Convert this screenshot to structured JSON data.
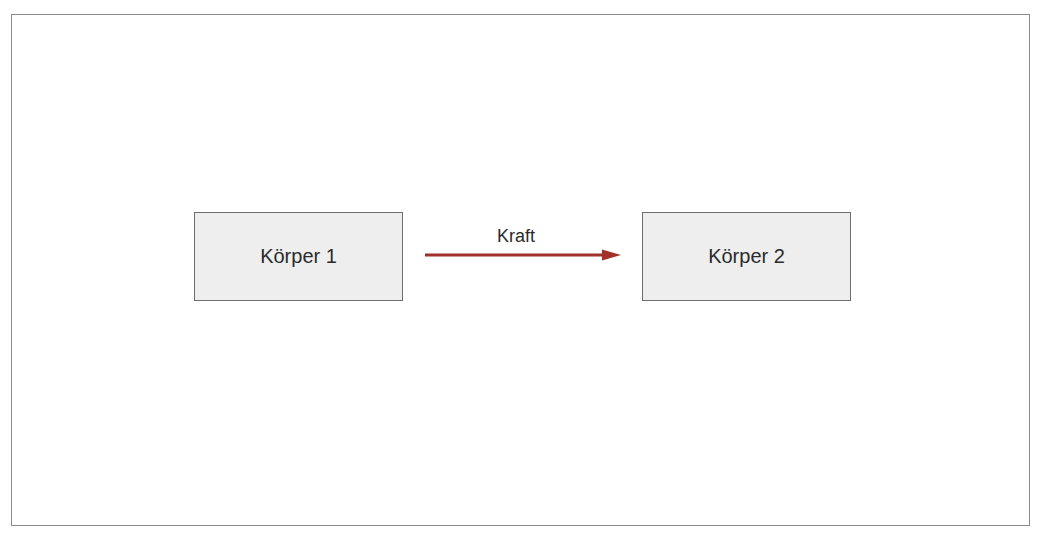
{
  "diagram": {
    "nodes": [
      {
        "id": "body1",
        "label": "Körper 1"
      },
      {
        "id": "body2",
        "label": "Körper 2"
      }
    ],
    "edges": [
      {
        "from": "body1",
        "to": "body2",
        "label": "Kraft",
        "color": "#a0322a"
      }
    ],
    "colors": {
      "box_fill": "#eeeeee",
      "box_border": "#6e6e6e",
      "frame_border": "#8a8a8a",
      "arrow": "#a0322a"
    }
  }
}
